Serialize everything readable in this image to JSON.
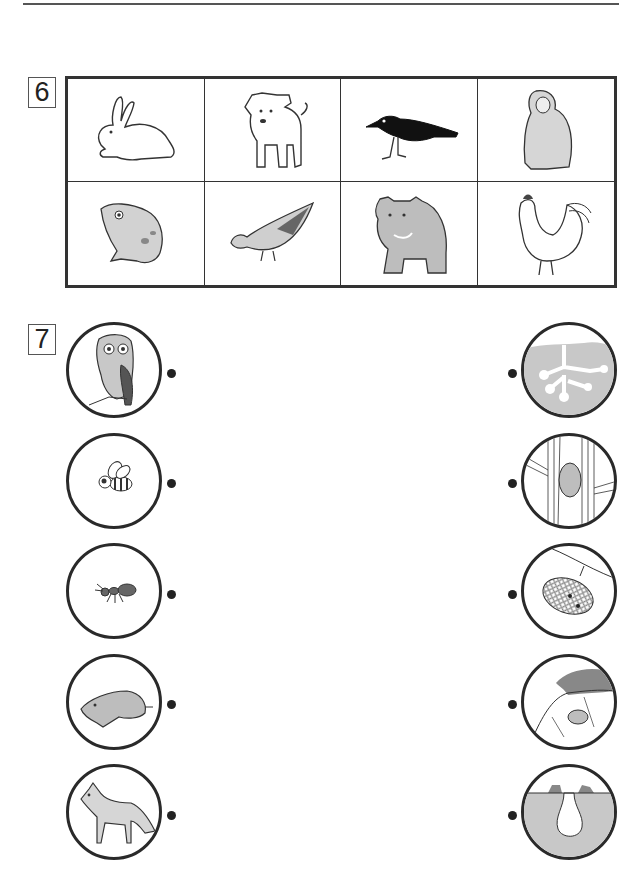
{
  "page": {
    "top_rule": true
  },
  "exercise6": {
    "number": "6",
    "grid": {
      "rows": 2,
      "columns": 4,
      "cells": [
        {
          "animal": "rabbit",
          "icon": "rabbit-icon",
          "fill": "outline"
        },
        {
          "animal": "puppy",
          "icon": "dog-icon",
          "fill": "outline"
        },
        {
          "animal": "crow",
          "icon": "crow-icon",
          "fill": "black"
        },
        {
          "animal": "monkey",
          "icon": "monkey-icon",
          "fill": "gray"
        },
        {
          "animal": "frog",
          "icon": "frog-icon",
          "fill": "gray"
        },
        {
          "animal": "pigeon",
          "icon": "pigeon-icon",
          "fill": "gray"
        },
        {
          "animal": "bear",
          "icon": "bear-icon",
          "fill": "gray"
        },
        {
          "animal": "rooster",
          "icon": "rooster-icon",
          "fill": "outline"
        }
      ]
    }
  },
  "exercise7": {
    "number": "7",
    "left_items": [
      {
        "animal": "owl",
        "icon": "owl-icon"
      },
      {
        "animal": "bee",
        "icon": "bee-icon"
      },
      {
        "animal": "ant",
        "icon": "ant-icon"
      },
      {
        "animal": "mole",
        "icon": "mole-icon"
      },
      {
        "animal": "fox",
        "icon": "fox-icon"
      }
    ],
    "right_items": [
      {
        "home": "ant tunnels underground",
        "icon": "ant-tunnels-icon"
      },
      {
        "home": "tree hollow",
        "icon": "tree-hollow-icon"
      },
      {
        "home": "beehive honeycomb",
        "icon": "beehive-icon"
      },
      {
        "home": "burrow in hillside",
        "icon": "hillside-burrow-icon"
      },
      {
        "home": "underground mole burrow",
        "icon": "mole-burrow-icon"
      }
    ],
    "colors": {
      "line": "#2a2a2a",
      "soil": "#c8c8c8",
      "gray_fill": "#bdbdbd",
      "dark_fill": "#555555"
    }
  }
}
